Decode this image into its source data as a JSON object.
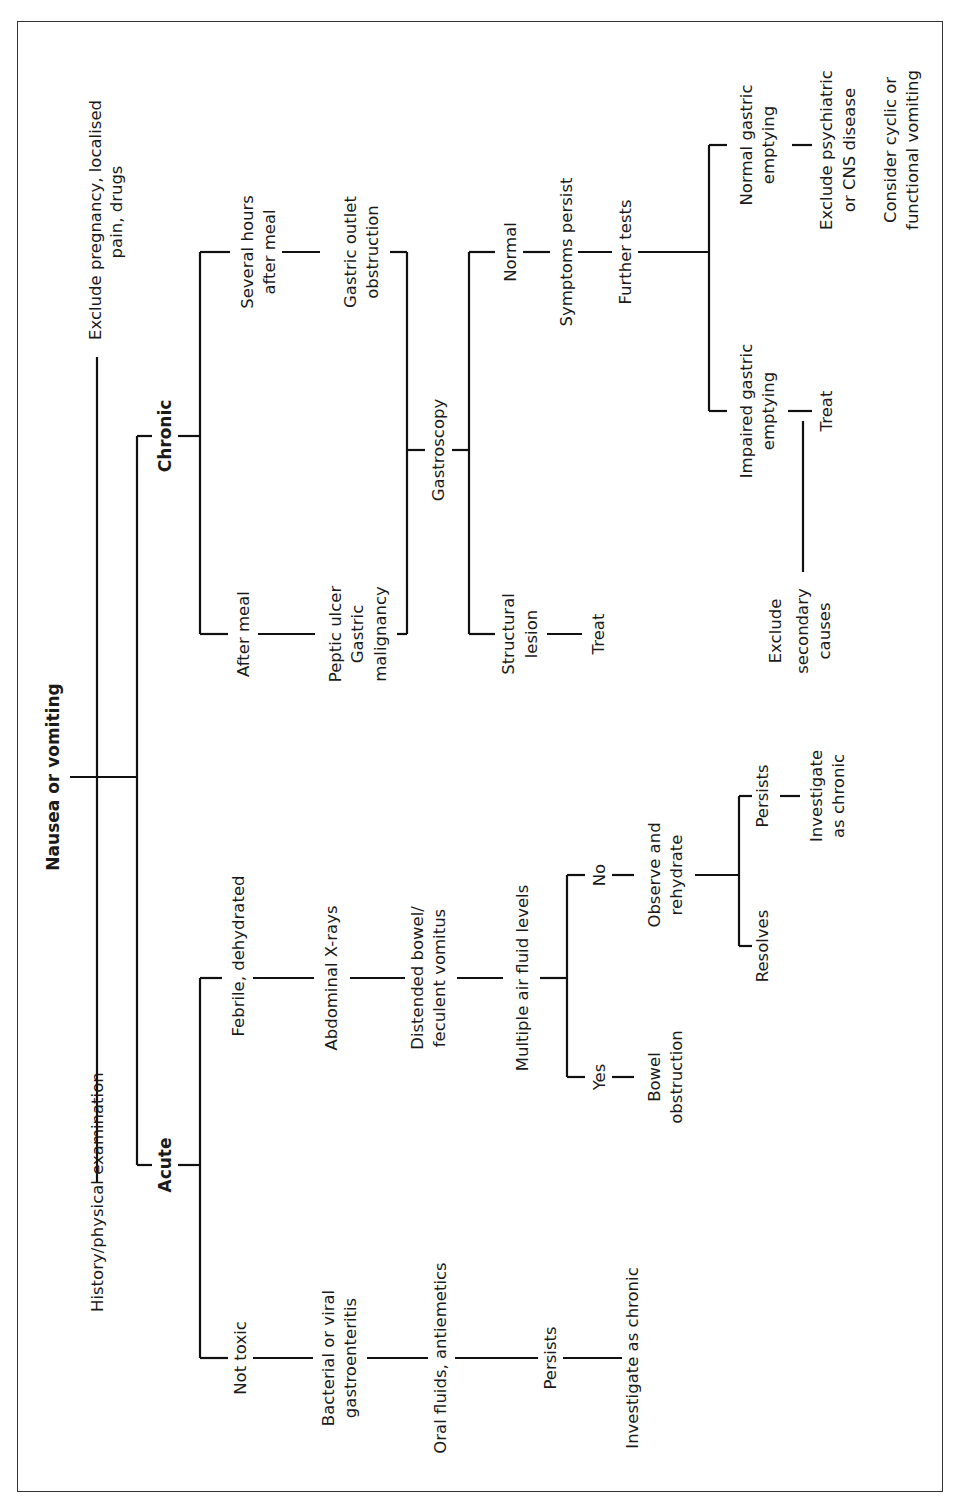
{
  "diagram": {
    "title": "Nausea or vomiting",
    "orientation": "rotated-90-ccw",
    "nodes": {
      "root": "Nausea or vomiting",
      "history": "History/physical examination",
      "exclude_preg_l1": "Exclude pregnancy, localised",
      "exclude_preg_l2": "pain, drugs",
      "chronic": "Chronic",
      "acute": "Acute",
      "several_hours_l1": "Several hours",
      "several_hours_l2": "after meal",
      "after_meal": "After meal",
      "gastric_outlet_l1": "Gastric outlet",
      "gastric_outlet_l2": "obstruction",
      "peptic_l1": "Peptic ulcer",
      "peptic_l2": "Gastric",
      "peptic_l3": "malignancy",
      "gastroscopy": "Gastroscopy",
      "normal": "Normal",
      "structural_l1": "Structural",
      "structural_l2": "lesion",
      "treat_structural": "Treat",
      "symptoms_persist": "Symptoms persist",
      "further_tests": "Further tests",
      "normal_ge_l1": "Normal gastric",
      "normal_ge_l2": "emptying",
      "impaired_ge_l1": "Impaired gastric",
      "impaired_ge_l2": "emptying",
      "treat_impaired": "Treat",
      "exclude_secondary_l1": "Exclude",
      "exclude_secondary_l2": "secondary",
      "exclude_secondary_l3": "causes",
      "exclude_psych_l1": "Exclude psychiatric",
      "exclude_psych_l2": "or CNS disease",
      "consider_cyclic_l1": "Consider cyclic or",
      "consider_cyclic_l2": "functional vomiting",
      "febrile": "Febrile, dehydrated",
      "not_toxic": "Not toxic",
      "abdominal_xrays": "Abdominal X-rays",
      "distended_l1": "Distended bowel/",
      "distended_l2": "feculent vomitus",
      "multiple_air": "Multiple air fluid levels",
      "no": "No",
      "yes": "Yes",
      "observe_l1": "Observe and",
      "observe_l2": "rehydrate",
      "bowel_obstruction_l1": "Bowel",
      "bowel_obstruction_l2": "obstruction",
      "resolves": "Resolves",
      "persists_acute": "Persists",
      "investigate_chronic_a_l1": "Investigate",
      "investigate_chronic_a_l2": "as chronic",
      "bacterial_l1": "Bacterial or viral",
      "bacterial_l2": "gastroenteritis",
      "oral_fluids": "Oral fluids, antiemetics",
      "persists_nt": "Persists",
      "investigate_chronic_b": "Investigate as chronic"
    }
  }
}
